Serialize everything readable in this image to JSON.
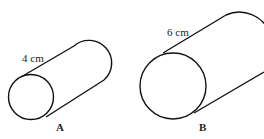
{
  "cylinders": [
    {
      "label": "A",
      "length_label": "4 cm"
    },
    {
      "label": "B",
      "length_label": "6 cm"
    }
  ]
}
